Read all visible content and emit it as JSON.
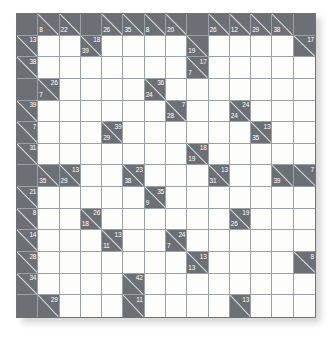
{
  "puzzle": {
    "type": "kakuro",
    "title": "Kakuro Puzzle Grid",
    "rows": 14,
    "cols": 14,
    "colors": {
      "block": "#6c7075",
      "open": "#fdfdfb",
      "gridline": "#9aa0a4",
      "clue_text": "#ffffff"
    },
    "legend": {
      "across_label": "across-clue",
      "down_label": "down-clue"
    },
    "cells": [
      [
        {
          "t": "block"
        },
        {
          "t": "clue",
          "down": 8
        },
        {
          "t": "clue",
          "down": 22
        },
        {
          "t": "block"
        },
        {
          "t": "clue",
          "down": 26
        },
        {
          "t": "clue",
          "down": 35
        },
        {
          "t": "clue",
          "down": 8
        },
        {
          "t": "clue",
          "down": 20
        },
        {
          "t": "block"
        },
        {
          "t": "clue",
          "down": 26
        },
        {
          "t": "clue",
          "down": 12
        },
        {
          "t": "clue",
          "down": 29
        },
        {
          "t": "clue",
          "down": 38
        },
        {
          "t": "block"
        }
      ],
      [
        {
          "t": "clue",
          "across": 13
        },
        {
          "t": "open"
        },
        {
          "t": "open"
        },
        {
          "t": "clue",
          "across": 18,
          "down": 39
        },
        {
          "t": "open"
        },
        {
          "t": "open"
        },
        {
          "t": "open"
        },
        {
          "t": "open"
        },
        {
          "t": "clue",
          "down": 19
        },
        {
          "t": "open"
        },
        {
          "t": "open"
        },
        {
          "t": "open"
        },
        {
          "t": "open"
        },
        {
          "t": "clue",
          "across": 17
        }
      ],
      [
        {
          "t": "clue",
          "across": 38
        },
        {
          "t": "open"
        },
        {
          "t": "open"
        },
        {
          "t": "open"
        },
        {
          "t": "open"
        },
        {
          "t": "open"
        },
        {
          "t": "open"
        },
        {
          "t": "open"
        },
        {
          "t": "clue",
          "across": 17,
          "down": 7
        },
        {
          "t": "open"
        },
        {
          "t": "open"
        },
        {
          "t": "open"
        },
        {
          "t": "open"
        },
        {
          "t": "open"
        }
      ],
      [
        {
          "t": "block"
        },
        {
          "t": "clue",
          "across": 26,
          "down": 7
        },
        {
          "t": "open"
        },
        {
          "t": "open"
        },
        {
          "t": "open"
        },
        {
          "t": "open"
        },
        {
          "t": "clue",
          "across": 36,
          "down": 24
        },
        {
          "t": "open"
        },
        {
          "t": "open"
        },
        {
          "t": "open"
        },
        {
          "t": "open"
        },
        {
          "t": "open"
        },
        {
          "t": "open"
        },
        {
          "t": "open"
        }
      ],
      [
        {
          "t": "clue",
          "across": 39
        },
        {
          "t": "open"
        },
        {
          "t": "open"
        },
        {
          "t": "open"
        },
        {
          "t": "open"
        },
        {
          "t": "open"
        },
        {
          "t": "open"
        },
        {
          "t": "clue",
          "across": 7,
          "down": 28
        },
        {
          "t": "open"
        },
        {
          "t": "open"
        },
        {
          "t": "clue",
          "across": 24,
          "down": 24
        },
        {
          "t": "open"
        },
        {
          "t": "open"
        },
        {
          "t": "open"
        }
      ],
      [
        {
          "t": "clue",
          "across": 7
        },
        {
          "t": "open"
        },
        {
          "t": "open"
        },
        {
          "t": "open"
        },
        {
          "t": "clue",
          "across": 39,
          "down": 29
        },
        {
          "t": "open"
        },
        {
          "t": "open"
        },
        {
          "t": "open"
        },
        {
          "t": "open"
        },
        {
          "t": "open"
        },
        {
          "t": "open"
        },
        {
          "t": "clue",
          "across": 13,
          "down": 35
        },
        {
          "t": "open"
        },
        {
          "t": "open"
        }
      ],
      [
        {
          "t": "clue",
          "across": 31
        },
        {
          "t": "open"
        },
        {
          "t": "open"
        },
        {
          "t": "open"
        },
        {
          "t": "open"
        },
        {
          "t": "open"
        },
        {
          "t": "open"
        },
        {
          "t": "open"
        },
        {
          "t": "clue",
          "across": 18,
          "down": 19
        },
        {
          "t": "open"
        },
        {
          "t": "open"
        },
        {
          "t": "open"
        },
        {
          "t": "open"
        },
        {
          "t": "open"
        }
      ],
      [
        {
          "t": "block"
        },
        {
          "t": "clue",
          "down": 35
        },
        {
          "t": "clue",
          "across": 13,
          "down": 29
        },
        {
          "t": "open"
        },
        {
          "t": "open"
        },
        {
          "t": "clue",
          "across": 23,
          "down": 38
        },
        {
          "t": "open"
        },
        {
          "t": "open"
        },
        {
          "t": "open"
        },
        {
          "t": "clue",
          "across": 13,
          "down": 31
        },
        {
          "t": "open"
        },
        {
          "t": "open"
        },
        {
          "t": "clue",
          "down": 39
        },
        {
          "t": "clue",
          "across": 7
        }
      ],
      [
        {
          "t": "clue",
          "across": 21
        },
        {
          "t": "open"
        },
        {
          "t": "open"
        },
        {
          "t": "open"
        },
        {
          "t": "open"
        },
        {
          "t": "open"
        },
        {
          "t": "clue",
          "across": 35,
          "down": 9
        },
        {
          "t": "open"
        },
        {
          "t": "open"
        },
        {
          "t": "open"
        },
        {
          "t": "open"
        },
        {
          "t": "open"
        },
        {
          "t": "open"
        },
        {
          "t": "open"
        }
      ],
      [
        {
          "t": "clue",
          "across": 8
        },
        {
          "t": "open"
        },
        {
          "t": "open"
        },
        {
          "t": "clue",
          "across": 26,
          "down": 18
        },
        {
          "t": "open"
        },
        {
          "t": "open"
        },
        {
          "t": "open"
        },
        {
          "t": "open"
        },
        {
          "t": "open"
        },
        {
          "t": "open"
        },
        {
          "t": "clue",
          "across": 19,
          "down": 26
        },
        {
          "t": "open"
        },
        {
          "t": "open"
        },
        {
          "t": "open"
        }
      ],
      [
        {
          "t": "clue",
          "across": 14
        },
        {
          "t": "open"
        },
        {
          "t": "open"
        },
        {
          "t": "open"
        },
        {
          "t": "clue",
          "across": 13,
          "down": 11
        },
        {
          "t": "open"
        },
        {
          "t": "open"
        },
        {
          "t": "clue",
          "across": 24,
          "down": 7
        },
        {
          "t": "open"
        },
        {
          "t": "open"
        },
        {
          "t": "open"
        },
        {
          "t": "open"
        },
        {
          "t": "open"
        },
        {
          "t": "open"
        }
      ],
      [
        {
          "t": "clue",
          "across": 28
        },
        {
          "t": "open"
        },
        {
          "t": "open"
        },
        {
          "t": "open"
        },
        {
          "t": "open"
        },
        {
          "t": "open"
        },
        {
          "t": "open"
        },
        {
          "t": "open"
        },
        {
          "t": "clue",
          "across": 13,
          "down": 13
        },
        {
          "t": "open"
        },
        {
          "t": "open"
        },
        {
          "t": "open"
        },
        {
          "t": "open"
        },
        {
          "t": "clue",
          "across": 8
        }
      ],
      [
        {
          "t": "clue",
          "across": 34
        },
        {
          "t": "open"
        },
        {
          "t": "open"
        },
        {
          "t": "open"
        },
        {
          "t": "open"
        },
        {
          "t": "clue",
          "across": 42
        },
        {
          "t": "open"
        },
        {
          "t": "open"
        },
        {
          "t": "open"
        },
        {
          "t": "open"
        },
        {
          "t": "open"
        },
        {
          "t": "open"
        },
        {
          "t": "open"
        },
        {
          "t": "open"
        }
      ],
      [
        {
          "t": "block"
        },
        {
          "t": "clue",
          "across": 29
        },
        {
          "t": "open"
        },
        {
          "t": "open"
        },
        {
          "t": "open"
        },
        {
          "t": "clue",
          "across": 11
        },
        {
          "t": "open"
        },
        {
          "t": "open"
        },
        {
          "t": "open"
        },
        {
          "t": "open"
        },
        {
          "t": "clue",
          "across": 13
        },
        {
          "t": "open"
        },
        {
          "t": "open"
        },
        {
          "t": "open"
        }
      ]
    ]
  }
}
